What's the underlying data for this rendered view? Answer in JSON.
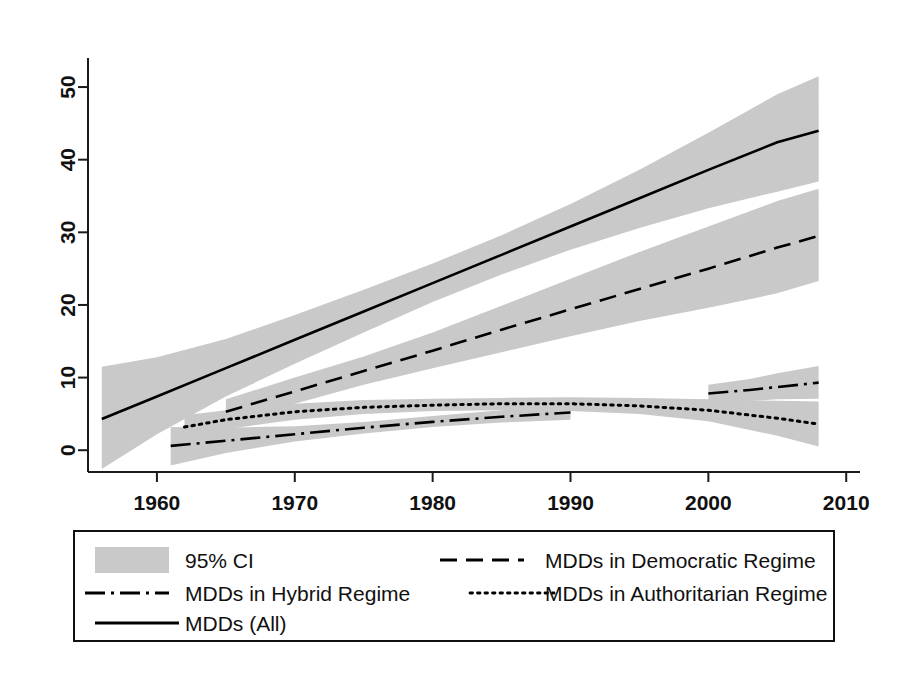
{
  "chart_data": {
    "type": "line",
    "title": "",
    "subtitle": "",
    "xlabel": "",
    "ylabel": "",
    "xlim": [
      1955,
      2011
    ],
    "ylim": [
      -3,
      54
    ],
    "grid": false,
    "legend_position": "bottom",
    "x_ticks": [
      1960,
      1970,
      1980,
      1990,
      2000,
      2010
    ],
    "y_ticks": [
      0,
      10,
      20,
      30,
      40,
      50
    ],
    "x_tick_labels": [
      "1960",
      "1970",
      "1980",
      "1990",
      "2000",
      "2010"
    ],
    "y_tick_labels": [
      "0",
      "10",
      "20",
      "30",
      "40",
      "50"
    ],
    "series": [
      {
        "name": "MDDs (All)",
        "style": "solid",
        "x": [
          1956,
          1960,
          1965,
          1970,
          1975,
          1980,
          1985,
          1990,
          1995,
          2000,
          2005,
          2008
        ],
        "values": [
          4.3,
          7.4,
          11.3,
          15.2,
          19.1,
          23.0,
          26.9,
          30.8,
          34.7,
          38.6,
          42.4,
          44.0
        ],
        "ci_lower": [
          -2.6,
          2.2,
          7.4,
          11.9,
          16.2,
          20.4,
          24.2,
          27.6,
          30.6,
          33.3,
          35.6,
          37.0
        ],
        "ci_upper": [
          11.5,
          12.8,
          15.3,
          18.6,
          22.1,
          25.7,
          29.6,
          33.9,
          38.6,
          43.7,
          49.0,
          51.5
        ]
      },
      {
        "name": "MDDs in Democratic Regime",
        "style": "dashed",
        "x": [
          1965,
          1970,
          1975,
          1980,
          1985,
          1990,
          1995,
          2000,
          2005,
          2008
        ],
        "values": [
          5.3,
          8.1,
          10.9,
          13.7,
          16.6,
          19.4,
          22.2,
          25.0,
          27.9,
          29.5
        ],
        "ci_lower": [
          3.8,
          6.4,
          9.0,
          11.3,
          13.5,
          15.7,
          17.8,
          19.6,
          21.6,
          23.3
        ],
        "ci_upper": [
          7.0,
          10.0,
          12.9,
          16.2,
          19.9,
          23.6,
          27.3,
          30.8,
          34.3,
          36.0
        ]
      },
      {
        "name": "MDDs in Hybrid Regime",
        "style": "dash-dot",
        "x": [
          1961,
          1965,
          1970,
          1975,
          1980,
          1985,
          1990,
          2000,
          2003,
          2005,
          2008
        ],
        "values": [
          0.6,
          1.3,
          2.2,
          3.1,
          3.9,
          4.6,
          5.2,
          7.8,
          8.3,
          8.7,
          9.3
        ],
        "ci_lower": [
          -2.1,
          -0.4,
          1.2,
          2.3,
          3.2,
          3.8,
          4.2,
          6.6,
          6.8,
          7.0,
          7.1
        ],
        "ci_upper": [
          3.2,
          3.1,
          3.3,
          3.9,
          4.7,
          5.5,
          6.3,
          9.0,
          9.8,
          10.6,
          11.6
        ]
      },
      {
        "name": "MDDs in Authoritarian Regime",
        "style": "dotted",
        "x": [
          1962,
          1965,
          1970,
          1975,
          1980,
          1985,
          1990,
          1995,
          2000,
          2005,
          2008
        ],
        "values": [
          3.2,
          4.2,
          5.3,
          5.9,
          6.2,
          6.4,
          6.4,
          6.1,
          5.5,
          4.4,
          3.6
        ],
        "ci_lower": [
          1.6,
          2.9,
          4.2,
          5.0,
          5.4,
          5.5,
          5.4,
          5.0,
          4.0,
          2.0,
          0.5
        ],
        "ci_upper": [
          4.8,
          5.5,
          6.4,
          6.9,
          7.1,
          7.2,
          7.3,
          7.2,
          7.0,
          6.8,
          6.7
        ]
      }
    ],
    "legend_entries": [
      {
        "label": "95% CI",
        "style": "band"
      },
      {
        "label": "MDDs in Democratic Regime",
        "style": "dashed"
      },
      {
        "label": "MDDs in Hybrid Regime",
        "style": "dash-dot"
      },
      {
        "label": "MDDs in Authoritarian Regime",
        "style": "dotted"
      },
      {
        "label": "MDDs (All)",
        "style": "solid"
      }
    ],
    "colors": {
      "ci_band": "#c9c9c9",
      "line": "#000000",
      "axis": "#1a1a1a",
      "background": "#ffffff"
    }
  }
}
